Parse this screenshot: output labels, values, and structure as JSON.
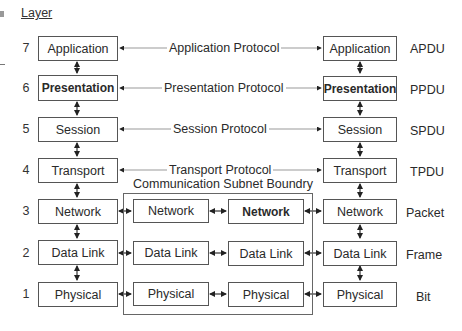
{
  "header": {
    "title": "Layer"
  },
  "layers": [
    {
      "number": "7",
      "name": "Application",
      "protocol": "Application Protocol",
      "unit": "APDU",
      "bold": false
    },
    {
      "number": "6",
      "name": "Presentation",
      "protocol": "Presentation Protocol",
      "unit": "PPDU",
      "bold": true
    },
    {
      "number": "5",
      "name": "Session",
      "protocol": "Session Protocol",
      "unit": "SPDU",
      "bold": false
    },
    {
      "number": "4",
      "name": "Transport",
      "protocol": "Transport Protocol",
      "unit": "TPDU",
      "bold": false
    },
    {
      "number": "3",
      "name": "Network",
      "protocol": "",
      "unit": "Packet",
      "bold": false
    },
    {
      "number": "2",
      "name": "Data Link",
      "protocol": "",
      "unit": "Frame",
      "bold": false
    },
    {
      "number": "1",
      "name": "Physical",
      "protocol": "",
      "unit": "Bit",
      "bold": false
    }
  ],
  "subnet": {
    "label": "Communication Subnet Boundry",
    "left_column": [
      "Network",
      "Data Link",
      "Physical"
    ],
    "right_column": [
      "Network",
      "Data Link",
      "Physical"
    ],
    "right_bold": [
      true,
      false,
      false
    ]
  },
  "right_host": {
    "column": [
      "Application",
      "Presentation",
      "Session",
      "Transport",
      "Network",
      "Data Link",
      "Physical"
    ]
  },
  "colors": {
    "box_border": "#555555",
    "protocol_line": "#999999",
    "text": "#2a2a2a"
  }
}
